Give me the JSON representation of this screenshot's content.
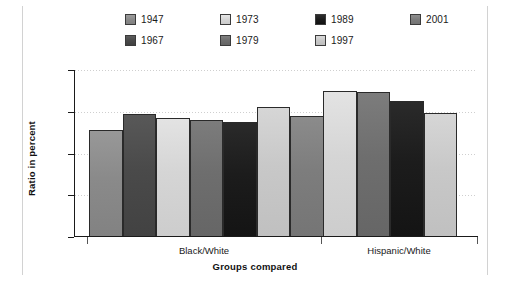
{
  "chart_data": {
    "type": "bar",
    "title": "",
    "xlabel": "Groups compared",
    "ylabel": "Ratio in percent",
    "categories": [
      "Black/White",
      "Hispanic/White"
    ],
    "ylim": [
      0,
      80
    ],
    "yticks": [
      0,
      20,
      40,
      60,
      80
    ],
    "ytick_labels": [
      "0",
      "20",
      "40",
      "60",
      "80"
    ],
    "grid": true,
    "legend_position": "top",
    "series": [
      {
        "name": "1947",
        "color": "#8a8a8a",
        "values": [
          51.5,
          null
        ]
      },
      {
        "name": "1967",
        "color": "#4a4a4a",
        "values": [
          59.0,
          null
        ]
      },
      {
        "name": "1973",
        "color": "#d5d5d5",
        "values": [
          57.0,
          69.8
        ]
      },
      {
        "name": "1979",
        "color": "#6e6e6e",
        "values": [
          56.0,
          69.5
        ]
      },
      {
        "name": "1989",
        "color": "#1c1c1c",
        "values": [
          55.0,
          65.0
        ]
      },
      {
        "name": "1997",
        "color": "#c8c8c8",
        "values": [
          62.3,
          59.5
        ]
      },
      {
        "name": "2001",
        "color": "#7d7d7d",
        "values": [
          58.0,
          null
        ]
      }
    ]
  },
  "legend": {
    "entries": [
      {
        "label": "1947",
        "color": "#8a8a8a"
      },
      {
        "label": "1967",
        "color": "#4a4a4a"
      },
      {
        "label": "1973",
        "color": "#d5d5d5"
      },
      {
        "label": "1979",
        "color": "#6e6e6e"
      },
      {
        "label": "1989",
        "color": "#1c1c1c"
      },
      {
        "label": "1997",
        "color": "#c8c8c8"
      },
      {
        "label": "2001",
        "color": "#7d7d7d"
      }
    ]
  }
}
